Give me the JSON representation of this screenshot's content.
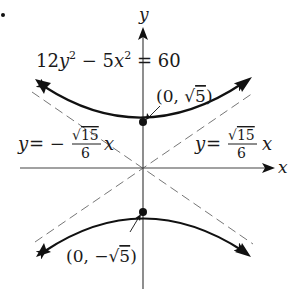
{
  "figure": {
    "bullet": "•",
    "axes": {
      "x_label": "x",
      "y_label": "y"
    },
    "equation": {
      "lhs_a_coef": "12",
      "lhs_a_var": "y",
      "lhs_a_exp": "2",
      "minus": " − 5",
      "lhs_b_var": "x",
      "lhs_b_exp": "2",
      "rhs": " = 60"
    },
    "vertices": [
      {
        "label_open": "(0, ",
        "radical": "√",
        "radicand": "5",
        "label_close": ")",
        "point": [
          0,
          2.236
        ]
      },
      {
        "label_open": "(0, −",
        "radical": "√",
        "radicand": "5",
        "label_close": ")",
        "point": [
          0,
          -2.236
        ]
      }
    ],
    "asymptotes": {
      "left": {
        "prefix_y": "y",
        "prefix_eq": " = −",
        "num_radical": "√",
        "num_radicand": "15",
        "denominator": "6",
        "suffix": "x"
      },
      "right": {
        "prefix_y": "y",
        "prefix_eq": " = ",
        "num_radical": "√",
        "num_radicand": "15",
        "denominator": "6",
        "suffix": "x"
      }
    },
    "colors": {
      "curve": "#111111",
      "axes": "#444444",
      "asymptote": "#777777",
      "text": "#1a1a1a"
    }
  }
}
